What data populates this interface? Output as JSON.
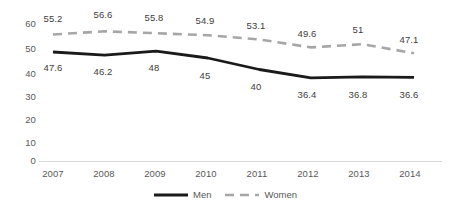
{
  "chart_data": {
    "type": "line",
    "title": "",
    "xlabel": "",
    "ylabel": "",
    "categories": [
      "2007",
      "2008",
      "2009",
      "2010",
      "2011",
      "2012",
      "2013",
      "2014"
    ],
    "series": [
      {
        "name": "Men",
        "style": "solid",
        "color": "#1a1a1a",
        "values": [
          47.6,
          46.2,
          48,
          45,
          40,
          36.4,
          36.8,
          36.6
        ],
        "labels": [
          "47.6",
          "46.2",
          "48",
          "45",
          "40",
          "36.4",
          "36.8",
          "36.6"
        ],
        "label_position": "below"
      },
      {
        "name": "Women",
        "style": "dashed",
        "color": "#a6a6a6",
        "values": [
          55.2,
          56.6,
          55.8,
          54.9,
          53.1,
          49.6,
          51,
          47.1
        ],
        "labels": [
          "55.2",
          "56.6",
          "55.8",
          "54.9",
          "53.1",
          "49.6",
          "51",
          "47.1"
        ],
        "label_position": "above"
      }
    ],
    "ylim": [
      0,
      60
    ],
    "yticks": [
      "0",
      "10",
      "20",
      "30",
      "40",
      "50",
      "60"
    ],
    "grid": false,
    "baseline_only": true,
    "legend_position": "bottom-center",
    "axis_color": "#d9d9d9",
    "tick_label_color": "#595959"
  },
  "legend": {
    "items": [
      {
        "label": "Men"
      },
      {
        "label": "Women"
      }
    ]
  }
}
